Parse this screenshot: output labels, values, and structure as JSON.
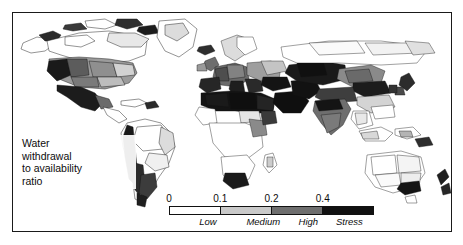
{
  "caption": {
    "line1": "Water",
    "line2": "withdrawal",
    "line3": "to availability",
    "line4": "ratio"
  },
  "legend": {
    "ticks": [
      {
        "label": "0",
        "pos_pct": 0
      },
      {
        "label": "0.1",
        "pos_pct": 25
      },
      {
        "label": "0.2",
        "pos_pct": 50
      },
      {
        "label": "0.4",
        "pos_pct": 75
      }
    ],
    "segments": [
      {
        "name": "Low",
        "color": "#ffffff",
        "center_pct": 12.5
      },
      {
        "name": "Medium",
        "color": "#c9c9c9",
        "center_pct": 37.5
      },
      {
        "name": "High",
        "color": "#6e6e6e",
        "center_pct": 62.5
      },
      {
        "name": "Stress",
        "color": "#111111",
        "center_pct": 87.5
      }
    ],
    "category_labels": [
      {
        "text": "Low",
        "pos_pct": 19
      },
      {
        "text": "Medium",
        "pos_pct": 46
      },
      {
        "text": "High",
        "pos_pct": 68
      },
      {
        "text": "Stress",
        "pos_pct": 88
      }
    ]
  },
  "chart_data": {
    "type": "heatmap",
    "title": "Water withdrawal to availability ratio",
    "subtitle": "",
    "xlabel": "",
    "ylabel": "",
    "grid": false,
    "legend_position": "bottom-center",
    "projection": "world map, country / river-basin polygons",
    "color_scale": {
      "name": "Water withdrawal to availability ratio",
      "type": "sequential-grayscale",
      "breaks": [
        0,
        0.1,
        0.2,
        0.4
      ],
      "classes": [
        {
          "range": "0 - 0.1",
          "label": "Low",
          "color": "#ffffff"
        },
        {
          "range": "0.1 - 0.2",
          "label": "Medium",
          "color": "#c9c9c9"
        },
        {
          "range": "0.2 - 0.4",
          "label": "High",
          "color": "#6e6e6e"
        },
        {
          "range": "> 0.4",
          "label": "Stress",
          "color": "#111111"
        }
      ]
    },
    "regions": [
      {
        "name": "Canada / Alaska",
        "class": "Low",
        "value": 0.03
      },
      {
        "name": "Northern United States",
        "class": "Low",
        "value": 0.07
      },
      {
        "name": "Central United States",
        "class": "High",
        "value": 0.3
      },
      {
        "name": "Southwestern United States",
        "class": "Stress",
        "value": 0.6
      },
      {
        "name": "Northern Mexico",
        "class": "Stress",
        "value": 0.65
      },
      {
        "name": "Central America",
        "class": "Low",
        "value": 0.08
      },
      {
        "name": "Amazon Basin",
        "class": "Low",
        "value": 0.02
      },
      {
        "name": "Andes / Peru coast",
        "class": "Stress",
        "value": 0.55
      },
      {
        "name": "Central Chile / Argentina",
        "class": "Stress",
        "value": 0.5
      },
      {
        "name": "Northern Europe",
        "class": "Medium",
        "value": 0.15
      },
      {
        "name": "Western Europe",
        "class": "High",
        "value": 0.3
      },
      {
        "name": "Southern Europe",
        "class": "Stress",
        "value": 0.5
      },
      {
        "name": "North Africa",
        "class": "Stress",
        "value": 0.8
      },
      {
        "name": "Sub-Saharan Africa",
        "class": "Low",
        "value": 0.03
      },
      {
        "name": "Southern Africa",
        "class": "Stress",
        "value": 0.45
      },
      {
        "name": "Middle East / Arabia",
        "class": "Stress",
        "value": 0.9
      },
      {
        "name": "Central Asia",
        "class": "Stress",
        "value": 0.7
      },
      {
        "name": "Siberia",
        "class": "Low",
        "value": 0.02
      },
      {
        "name": "Northern India / Indus",
        "class": "Stress",
        "value": 0.75
      },
      {
        "name": "Southern India",
        "class": "High",
        "value": 0.35
      },
      {
        "name": "Northern China",
        "class": "Stress",
        "value": 0.6
      },
      {
        "name": "Southern China",
        "class": "Medium",
        "value": 0.15
      },
      {
        "name": "Southeast Asia",
        "class": "Low",
        "value": 0.05
      },
      {
        "name": "Interior Australia",
        "class": "Low",
        "value": 0.04
      },
      {
        "name": "Southeastern Australia",
        "class": "Stress",
        "value": 0.5
      }
    ]
  }
}
